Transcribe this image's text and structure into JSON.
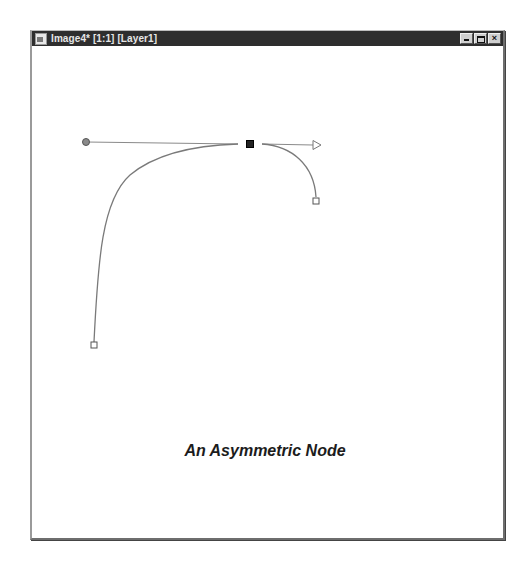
{
  "window": {
    "title": "Image4* [1:1] [Layer1]",
    "controls": {
      "minimize": "_",
      "maximize": "□",
      "close": "×"
    }
  },
  "canvas": {
    "caption": "An Asymmetric Node",
    "node": {
      "type": "asymmetric",
      "anchor": [
        250,
        144
      ]
    },
    "handles": {
      "left": {
        "marker": "circle",
        "pos": [
          86,
          142
        ]
      },
      "right": {
        "marker": "arrow",
        "pos": [
          320,
          145
        ]
      }
    },
    "curve_endpoints": {
      "left_end": [
        94,
        345
      ],
      "right_end": [
        316,
        201
      ]
    },
    "colors": {
      "stroke": "#7a7a7a",
      "node_fill": "#222222",
      "handle_line": "#8a8a8a"
    }
  }
}
